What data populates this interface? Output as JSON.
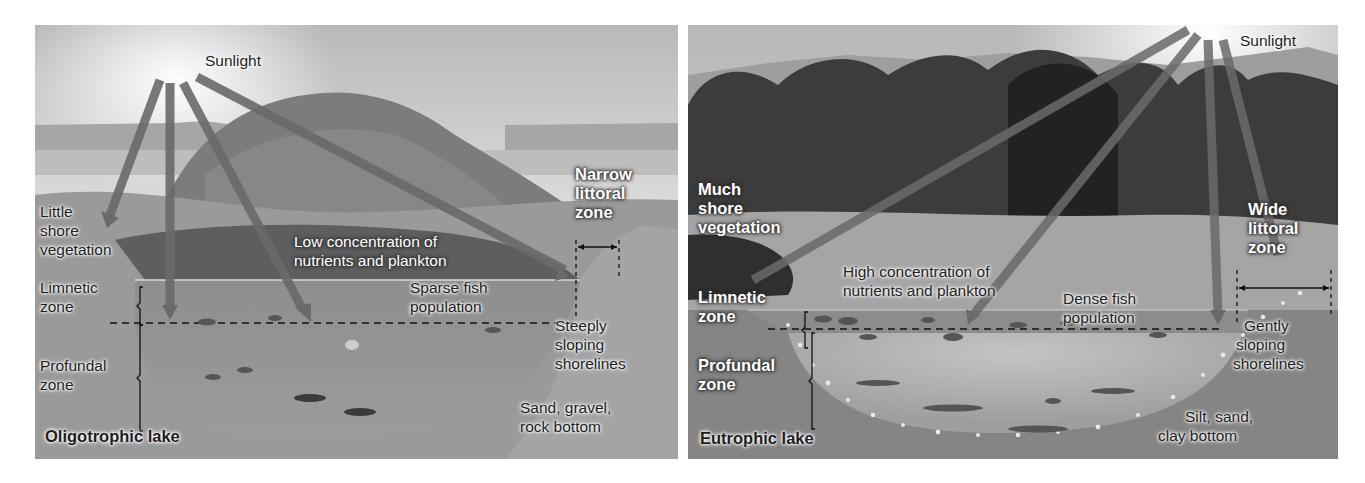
{
  "figure": {
    "left_panel": {
      "title": "Oligotrophic lake",
      "labels": {
        "sunlight": "Sunlight",
        "shore_vegetation": [
          "Little",
          "shore",
          "vegetation"
        ],
        "littoral_zone": [
          "Narrow",
          "littoral",
          "zone"
        ],
        "nutrients": [
          "Low concentration of",
          "nutrients and plankton"
        ],
        "limnetic_zone": [
          "Limnetic",
          "zone"
        ],
        "fish_population": [
          "Sparse fish",
          "population"
        ],
        "profundal_zone": [
          "Profundal",
          "zone"
        ],
        "shorelines": [
          "Steeply",
          "sloping",
          "shorelines"
        ],
        "bottom": [
          "Sand, gravel,",
          "rock bottom"
        ]
      }
    },
    "right_panel": {
      "title": "Eutrophic lake",
      "labels": {
        "sunlight": "Sunlight",
        "shore_vegetation": [
          "Much",
          "shore",
          "vegetation"
        ],
        "littoral_zone": [
          "Wide",
          "littoral",
          "zone"
        ],
        "nutrients": [
          "High concentration of",
          "nutrients and plankton"
        ],
        "limnetic_zone": [
          "Limnetic",
          "zone"
        ],
        "fish_population": [
          "Dense fish",
          "population"
        ],
        "profundal_zone": [
          "Profundal",
          "zone"
        ],
        "shorelines": [
          "Gently",
          "sloping",
          "shorelines"
        ],
        "bottom": [
          "Silt, sand,",
          "clay bottom"
        ]
      }
    },
    "colors": {
      "background": "#ffffff",
      "sky": "#d4d4d4",
      "ground": "#9a9a9a",
      "water_upper": "#8c8c8c",
      "water_deep": "#a8a8a8",
      "light_ray": "#6e6e6e",
      "vegetation": "#3c3c3c"
    }
  }
}
